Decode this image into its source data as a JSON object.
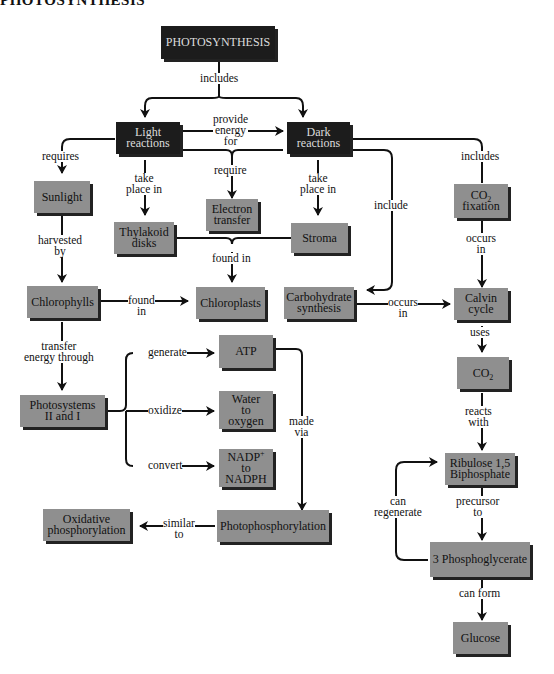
{
  "title": "PHOTOSYNTHESIS",
  "nodes": {
    "photosynthesis": "PHOTOSYNTHESIS",
    "light_reactions": [
      "Light",
      "reactions"
    ],
    "dark_reactions": [
      "Dark",
      "reactions"
    ],
    "sunlight": "Sunlight",
    "electron_transfer": [
      "Electron",
      "transfer"
    ],
    "thylakoid_disks": [
      "Thylakoid",
      "disks"
    ],
    "stroma": "Stroma",
    "co2_fixation": [
      "CO",
      "2",
      "fixation"
    ],
    "chlorophylls": "Chlorophylls",
    "chloroplasts": "Chloroplasts",
    "carbohydrate_synthesis": [
      "Carbohydrate",
      "synthesis"
    ],
    "calvin_cycle": [
      "Calvin",
      "cycle"
    ],
    "atp": "ATP",
    "co2": [
      "CO",
      "2"
    ],
    "photosystems": [
      "Photosystems",
      "II and I"
    ],
    "water_to_oxygen": [
      "Water",
      "to",
      "oxygen"
    ],
    "nadp_to_nadph": [
      "NADP",
      "+",
      "to",
      "NADPH"
    ],
    "ribulose": [
      "Ribulose 1,5",
      "Biphosphate"
    ],
    "oxidative_phosphorylation": [
      "Oxidative",
      "phosphorylation"
    ],
    "photophosphorylation": "Photophosphorylation",
    "phosphoglycerate": "3 Phosphoglycerate",
    "glucose": "Glucose"
  },
  "links": {
    "includes_top": "includes",
    "provide_energy_for": [
      "provide",
      "energy",
      "for"
    ],
    "requires": "requires",
    "require": "require",
    "take_place_in_light": [
      "take",
      "place in"
    ],
    "take_place_in_dark": [
      "take",
      "place in"
    ],
    "include": "include",
    "includes_right": "includes",
    "harvested_by": [
      "harvested",
      "by"
    ],
    "found_in_mid": "found in",
    "occurs_in_co2": [
      "occurs",
      "in"
    ],
    "found_in_chloro": [
      "found",
      "in"
    ],
    "occurs_in_carb": [
      "occurs",
      "in"
    ],
    "transfer_energy_through": [
      "transfer",
      "energy through"
    ],
    "uses": "uses",
    "generate": "generate",
    "made_via": [
      "made",
      "via"
    ],
    "oxidize": "oxidize",
    "reacts_with": [
      "reacts",
      "with"
    ],
    "convert": "convert",
    "can_regenerate": [
      "can",
      "regenerate"
    ],
    "precursor_to": [
      "precursor",
      "to"
    ],
    "similar_to": [
      "similar",
      "to"
    ],
    "can_form": "can form"
  }
}
